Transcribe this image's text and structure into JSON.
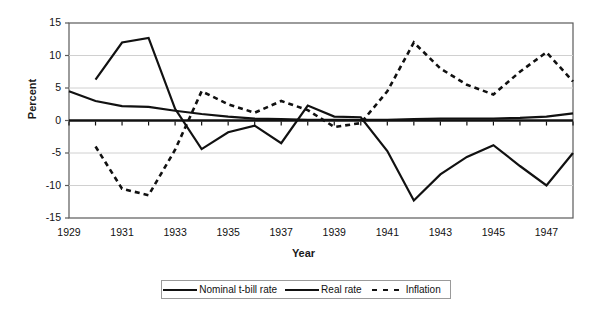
{
  "chart_data": {
    "type": "line",
    "title": "",
    "xlabel": "Year",
    "ylabel": "Percent",
    "ylim": [
      -15,
      15
    ],
    "yticks": [
      15,
      10,
      5,
      0,
      -5,
      -10,
      -15
    ],
    "xlim": [
      1929,
      1948
    ],
    "xticks": [
      1929,
      1931,
      1933,
      1935,
      1937,
      1939,
      1941,
      1943,
      1945,
      1947
    ],
    "x": [
      1929,
      1930,
      1931,
      1932,
      1933,
      1934,
      1935,
      1936,
      1937,
      1938,
      1939,
      1940,
      1941,
      1942,
      1943,
      1944,
      1945,
      1946,
      1947,
      1948
    ],
    "grid": "horizontal",
    "legend_position": "bottom",
    "series": [
      {
        "name": "Nominal t-bill rate",
        "style": "solid",
        "color": "#111111",
        "values": [
          4.5,
          3.0,
          2.2,
          2.1,
          1.5,
          1.0,
          0.6,
          0.3,
          0.2,
          0.1,
          0.1,
          0.1,
          0.1,
          0.2,
          0.3,
          0.3,
          0.3,
          0.4,
          0.6,
          1.1
        ]
      },
      {
        "name": "Real rate",
        "style": "solid",
        "color": "#111111",
        "values": [
          null,
          6.3,
          12.0,
          12.7,
          1.8,
          -4.4,
          -1.8,
          -0.8,
          -3.5,
          2.3,
          0.6,
          0.5,
          -4.7,
          -12.3,
          -8.3,
          -5.6,
          -3.8,
          -7.0,
          -10.0,
          -5.0
        ]
      },
      {
        "name": "Inflation",
        "style": "dashed",
        "color": "#111111",
        "values": [
          null,
          -4.0,
          -10.5,
          -11.5,
          -4.5,
          4.5,
          2.5,
          1.2,
          3.0,
          1.6,
          -1.0,
          -0.4,
          4.5,
          12.0,
          8.0,
          5.5,
          4.0,
          7.5,
          10.5,
          6.0
        ]
      }
    ]
  },
  "legend": {
    "items": [
      {
        "label": "Nominal t-bill rate",
        "style": "solid"
      },
      {
        "label": "Real rate",
        "style": "solid"
      },
      {
        "label": "Inflation",
        "style": "dashed"
      }
    ]
  },
  "axes": {
    "y_title": "Percent",
    "x_title": "Year"
  }
}
